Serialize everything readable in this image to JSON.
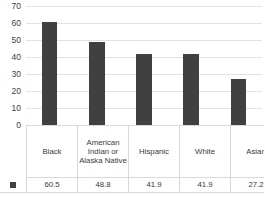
{
  "chart_data": {
    "type": "bar",
    "title": "",
    "xlabel": "",
    "ylabel": "",
    "categories": [
      "Black",
      "American Indian or Alaska Native",
      "Hispanic",
      "White",
      "Asian"
    ],
    "values": [
      60.5,
      48.8,
      41.9,
      41.9,
      27.2
    ],
    "ylim": [
      0,
      70
    ],
    "yticks": [
      70,
      60,
      50,
      40,
      30,
      20,
      10,
      0
    ],
    "ytick_labels": [
      "70",
      "60",
      "50",
      "40",
      "30",
      "20",
      "10",
      "0"
    ],
    "grid": true,
    "legend_position": "data-table-row",
    "series": [
      {
        "name": "",
        "values": [
          60.5,
          48.8,
          41.9,
          41.9,
          27.2
        ],
        "color": "#404040"
      }
    ],
    "value_labels": [
      "60.5",
      "48.8",
      "41.9",
      "41.9",
      "27.2"
    ]
  },
  "colors": {
    "bar": "#404040",
    "gridline": "#e2e2e2",
    "baseline": "#d2d2d2",
    "table_border": "#d9d9d9",
    "text": "#3a3a3a",
    "background": "#ffffff"
  },
  "legend": {
    "marker": "square-swatch"
  }
}
